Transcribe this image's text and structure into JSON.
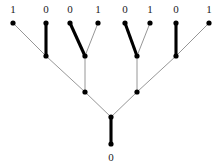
{
  "figure": {
    "width": 221,
    "height": 168,
    "background": "#ffffff",
    "edge_colors": {
      "bold": "#000000",
      "thin": "#8a8a8a"
    },
    "node_color": "#000000"
  },
  "nodes": {
    "leaf_1": {
      "label": "1",
      "x": 13,
      "y": 23,
      "label_x": 13,
      "label_y": 13
    },
    "leaf_2": {
      "label": "0",
      "x": 46,
      "y": 23,
      "label_x": 46,
      "label_y": 13
    },
    "leaf_3": {
      "label": "0",
      "x": 70,
      "y": 23,
      "label_x": 70,
      "label_y": 13
    },
    "leaf_4": {
      "label": "1",
      "x": 98,
      "y": 23,
      "label_x": 98,
      "label_y": 13
    },
    "leaf_5": {
      "label": "0",
      "x": 125,
      "y": 23,
      "label_x": 125,
      "label_y": 13
    },
    "leaf_6": {
      "label": "1",
      "x": 150,
      "y": 23,
      "label_x": 150,
      "label_y": 13
    },
    "leaf_7": {
      "label": "0",
      "x": 176,
      "y": 23,
      "label_x": 176,
      "label_y": 13
    },
    "leaf_8": {
      "label": "1",
      "x": 209,
      "y": 23,
      "label_x": 209,
      "label_y": 13
    },
    "inner_a": {
      "label": "",
      "x": 46,
      "y": 56
    },
    "inner_b": {
      "label": "",
      "x": 85,
      "y": 56
    },
    "inner_c": {
      "label": "",
      "x": 137,
      "y": 56
    },
    "inner_d": {
      "label": "",
      "x": 176,
      "y": 56
    },
    "mid_left": {
      "label": "",
      "x": 85,
      "y": 92
    },
    "mid_right": {
      "label": "",
      "x": 137,
      "y": 92
    },
    "root": {
      "label": "",
      "x": 111,
      "y": 117
    },
    "bottom": {
      "label": "0",
      "x": 111,
      "y": 144,
      "label_x": 111,
      "label_y": 161
    }
  },
  "edges": [
    {
      "name": "edge-leaf1-innerA",
      "from": "leaf_1",
      "to": "inner_a",
      "weight": "thin"
    },
    {
      "name": "edge-leaf2-innerA",
      "from": "leaf_2",
      "to": "inner_a",
      "weight": "bold"
    },
    {
      "name": "edge-leaf3-innerB",
      "from": "leaf_3",
      "to": "inner_b",
      "weight": "bold"
    },
    {
      "name": "edge-leaf4-innerB",
      "from": "leaf_4",
      "to": "inner_b",
      "weight": "thin"
    },
    {
      "name": "edge-leaf5-innerC",
      "from": "leaf_5",
      "to": "inner_c",
      "weight": "bold"
    },
    {
      "name": "edge-leaf6-innerC",
      "from": "leaf_6",
      "to": "inner_c",
      "weight": "thin"
    },
    {
      "name": "edge-leaf7-innerD",
      "from": "leaf_7",
      "to": "inner_d",
      "weight": "bold"
    },
    {
      "name": "edge-leaf8-innerD",
      "from": "leaf_8",
      "to": "inner_d",
      "weight": "thin"
    },
    {
      "name": "edge-innerA-midLeft",
      "from": "inner_a",
      "to": "mid_left",
      "weight": "thin"
    },
    {
      "name": "edge-innerB-midLeft",
      "from": "inner_b",
      "to": "mid_left",
      "weight": "thin"
    },
    {
      "name": "edge-innerC-midRight",
      "from": "inner_c",
      "to": "mid_right",
      "weight": "thin"
    },
    {
      "name": "edge-innerD-midRight",
      "from": "inner_d",
      "to": "mid_right",
      "weight": "thin"
    },
    {
      "name": "edge-midLeft-root",
      "from": "mid_left",
      "to": "root",
      "weight": "thin"
    },
    {
      "name": "edge-midRight-root",
      "from": "mid_right",
      "to": "root",
      "weight": "thin"
    },
    {
      "name": "edge-root-bottom",
      "from": "root",
      "to": "bottom",
      "weight": "bold"
    }
  ],
  "labels": {
    "leaf_bits": [
      "1",
      "0",
      "0",
      "1",
      "0",
      "1",
      "0",
      "1"
    ],
    "root_bit": "0"
  }
}
